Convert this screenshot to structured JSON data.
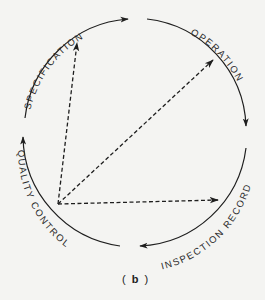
{
  "diagram": {
    "caption_open": "(",
    "caption_letter": "b",
    "caption_close": ")",
    "stages": [
      {
        "label": "SPECIFICATION"
      },
      {
        "label": "OPERATION"
      },
      {
        "label": "INSPECTION RECORD"
      },
      {
        "label": "QUALITY CONTROL"
      }
    ],
    "colors": {
      "line": "#1e1e1e",
      "background": "#f4f4f2"
    },
    "cycle_direction": "clockwise",
    "feedback_arrows": [
      {
        "from": "QUALITY CONTROL",
        "to": "SPECIFICATION",
        "style": "dashed"
      },
      {
        "from": "QUALITY CONTROL",
        "to": "OPERATION",
        "style": "dashed"
      },
      {
        "from": "QUALITY CONTROL",
        "to": "INSPECTION RECORD",
        "style": "dashed"
      }
    ]
  }
}
